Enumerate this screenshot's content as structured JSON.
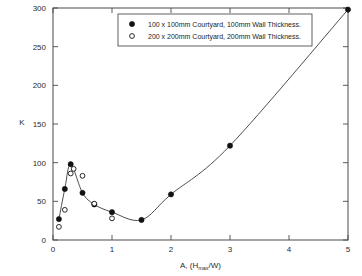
{
  "chart_data": {
    "type": "scatter",
    "title": "",
    "xlabel": "A, (Hmax/W)",
    "xlabel_parts": {
      "prefix": "A, (H",
      "subscript": "max",
      "suffix": "/W)"
    },
    "ylabel": "K",
    "xlim": [
      0,
      5
    ],
    "ylim": [
      0,
      300
    ],
    "xticks": [
      0,
      1,
      2,
      3,
      4,
      5
    ],
    "xtick_labels": [
      "0",
      "1",
      "2",
      "3",
      "4",
      "5"
    ],
    "yticks": [
      0,
      50,
      100,
      150,
      200,
      250,
      300
    ],
    "ytick_labels": [
      "0",
      "50",
      "100",
      "150",
      "200",
      "250",
      "300"
    ],
    "grid": false,
    "legend_position": "top-center",
    "series": [
      {
        "name": "100 x 100mm Courtyard, 100mm Wall Thickness.",
        "marker": "filled-circle",
        "has_line": true,
        "x": [
          0.1,
          0.2,
          0.3,
          0.5,
          0.7,
          1.0,
          1.5,
          2.0,
          3.0,
          5.0
        ],
        "values": [
          27,
          66,
          98,
          61,
          46,
          36,
          26,
          59,
          122,
          298
        ]
      },
      {
        "name": "200 x 200mm Courtyard, 200mm Wall Thickness.",
        "marker": "open-circle",
        "has_line": false,
        "x": [
          0.1,
          0.2,
          0.3,
          0.35,
          0.5,
          0.7,
          1.0
        ],
        "values": [
          17,
          39,
          86,
          92,
          83,
          47,
          28
        ]
      }
    ]
  },
  "axis": {
    "y_axis_label": "K",
    "x_axis_label_prefix": "A, (H",
    "x_axis_label_sub": "max",
    "x_axis_label_suffix": "/W)"
  },
  "legend": {
    "entries": [
      {
        "label": "100 x 100mm Courtyard, 100mm Wall Thickness.",
        "marker": "filled-circle"
      },
      {
        "label": "200 x 200mm Courtyard, 200mm Wall Thickness.",
        "marker": "open-circle"
      }
    ]
  },
  "colors": {
    "marker": "#121212",
    "line": "#3a3a3a",
    "frame": "#4a4a4a",
    "text": "#2b2b2b",
    "background": "#ffffff"
  }
}
